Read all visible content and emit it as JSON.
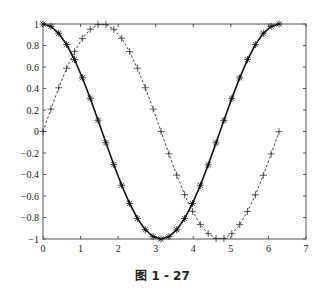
{
  "caption": "图 1 - 27",
  "chart_data": {
    "type": "line",
    "title": "",
    "xlabel": "",
    "ylabel": "",
    "xlim": [
      0,
      7
    ],
    "ylim": [
      -1,
      1
    ],
    "xticks": [
      "0",
      "1",
      "2",
      "3",
      "4",
      "5",
      "6",
      "7"
    ],
    "yticks": [
      "-1",
      "-0.8",
      "-0.6",
      "-0.4",
      "-0.2",
      "0",
      "0.2",
      "0.4",
      "0.6",
      "0.8",
      "1"
    ],
    "grid": false,
    "legend": null,
    "x_start": 0,
    "x_step": 0.2094,
    "x_count": 31,
    "series": [
      {
        "name": "sin(x)",
        "style": "dashed",
        "marker": "+",
        "color": "#333333",
        "function": "sin"
      },
      {
        "name": "cos(x)",
        "style": "solid",
        "marker": "*",
        "color": "#111111",
        "function": "cos"
      }
    ]
  }
}
